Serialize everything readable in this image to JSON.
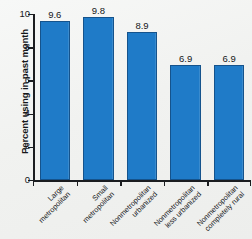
{
  "chart_data": {
    "type": "bar",
    "title": "",
    "subtitle": "",
    "xlabel": "",
    "ylabel": "Percent using in past month",
    "categories": [
      "Large metropolitan",
      "Small metropolitan",
      "Nonmetropolitan urbanized",
      "Nonmetropolitan less urbanized",
      "Nonmetropolitan completely rural"
    ],
    "category_lines": [
      [
        "Large",
        "metropolitan"
      ],
      [
        "Small",
        "metropolitan"
      ],
      [
        "Nonmetropolitan",
        "urbanized"
      ],
      [
        "Nonmetropolitan",
        "less urbanized"
      ],
      [
        "Nonmetropolitan",
        "completely rural"
      ]
    ],
    "values": [
      9.6,
      9.8,
      8.9,
      6.9,
      6.9
    ],
    "value_labels": [
      "9.6",
      "9.8",
      "8.9",
      "6.9",
      "6.9"
    ],
    "ylim": [
      0,
      10
    ],
    "y_ticks": [
      0,
      2,
      4,
      6,
      8,
      10
    ],
    "y_tick_labels": [
      "0",
      "2",
      "4",
      "6",
      "8",
      "10"
    ],
    "grid": false,
    "legend": false,
    "legend_position": "none",
    "bar_color": "#1f7bc8",
    "bar_edge_color": "#15538c",
    "axis_color": "#1b1d20",
    "background_color": "#f3f4f2"
  }
}
